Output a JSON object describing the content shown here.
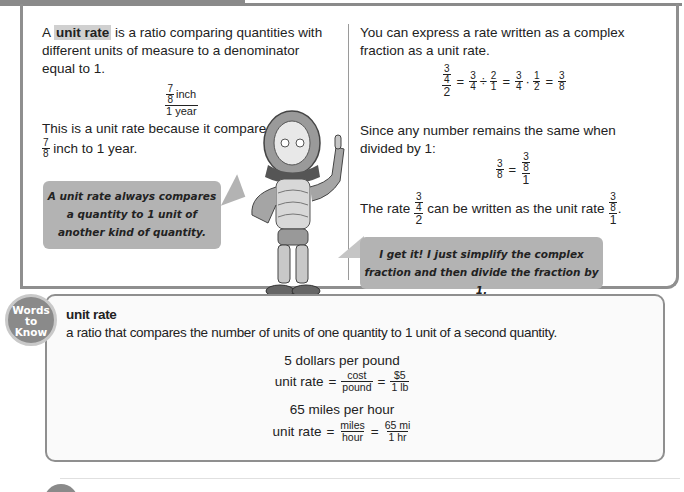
{
  "left_column": {
    "intro_prefix": "A ",
    "intro_term": "unit rate",
    "intro_rest": " is a ratio comparing quantities with different units of measure to a denominator equal to 1.",
    "example_fraction": {
      "inner_num": "7",
      "inner_den": "8",
      "num_unit": "inch",
      "den": "1 year"
    },
    "explanation_line1": "This is a unit rate because it compares",
    "explanation_frac_num": "7",
    "explanation_frac_den": "8",
    "explanation_line2": " inch to 1 year.",
    "speech_bubble": [
      "A unit rate always compares",
      "a quantity to 1 unit of",
      "another kind of quantity."
    ]
  },
  "right_column": {
    "intro": "You can express a rate written as a complex fraction as a unit rate.",
    "equation1": {
      "complex_num_num": "3",
      "complex_num_den": "4",
      "complex_den": "2",
      "eq": "=",
      "t1_num": "3",
      "t1_den": "4",
      "div": "÷",
      "t2_num": "2",
      "t2_den": "1",
      "t3_num": "3",
      "t3_den": "4",
      "dot": "·",
      "t4_num": "1",
      "t4_den": "2",
      "result_num": "3",
      "result_den": "8"
    },
    "since_text": "Since any number remains the same when divided by 1:",
    "equation2": {
      "left_num": "3",
      "left_den": "8",
      "eq": "=",
      "right_num_num": "3",
      "right_num_den": "8",
      "right_den": "1"
    },
    "rate_sentence": {
      "prefix": "The rate ",
      "frac_num_num": "3",
      "frac_num_den": "4",
      "frac_den": "2",
      "middle": " can be written as the unit rate ",
      "unit_num_num": "3",
      "unit_num_den": "8",
      "unit_den": "1",
      "suffix": "."
    },
    "speech_bubble": [
      "I get it! I just simplify the complex",
      "fraction and then divide the fraction by 1."
    ]
  },
  "words_to_know": {
    "badge": [
      "Words",
      "to",
      "Know"
    ],
    "term": "unit rate",
    "definition": "a ratio that compares the number of units of one quantity to 1 unit of a second quantity.",
    "example1_title": "5 dollars per pound",
    "example1": {
      "label": "unit rate",
      "eq": "=",
      "f1_num": "cost",
      "f1_den": "pound",
      "f2_num": "$5",
      "f2_den": "1 lb"
    },
    "example2_title": "65 miles per hour",
    "example2": {
      "label": "unit rate",
      "eq": "=",
      "f1_num": "miles",
      "f1_den": "hour",
      "f2_num": "65 mi",
      "f2_den": "1 hr"
    }
  },
  "illustration": {
    "icon": "robot-character-icon"
  },
  "colors": {
    "frame": "#8f8f8f",
    "bubble": "#b3b3b3",
    "highlight": "#d0d0d0",
    "badge": "#8a8a8a"
  }
}
